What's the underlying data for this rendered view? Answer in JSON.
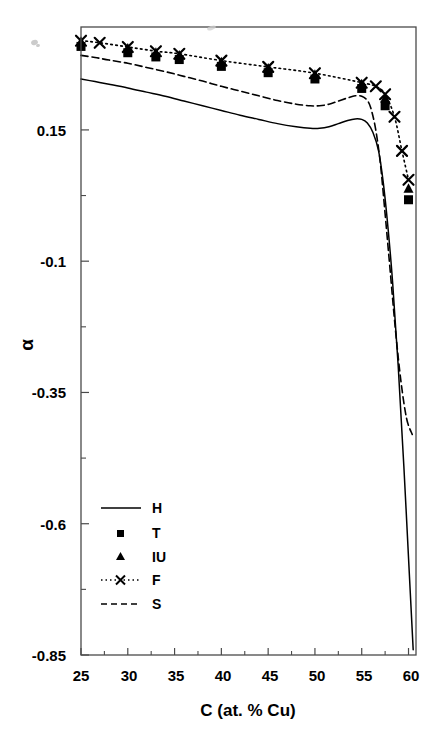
{
  "chart_data": {
    "type": "line",
    "title": "",
    "xlabel": "C (at. % Cu)",
    "ylabel": "α",
    "xlim": [
      25,
      60.8
    ],
    "ylim": [
      -0.85,
      0.346
    ],
    "xticks": [
      25,
      30,
      35,
      40,
      45,
      50,
      55,
      60
    ],
    "xticklabels": [
      "25",
      "30",
      "35",
      "40",
      "45",
      "50",
      "55",
      "60"
    ],
    "xminorticks": [
      27.5,
      32.5,
      37.5,
      42.5,
      47.5,
      52.5,
      57.5
    ],
    "yticks": [
      0.15,
      -0.1,
      -0.35,
      -0.6,
      -0.85
    ],
    "yticklabels": [
      "0.15",
      "-0.1",
      "-0.35",
      "-0.6",
      "-0.85"
    ],
    "yminorticks": [
      0.025,
      -0.225,
      -0.475,
      -0.725
    ],
    "grid": false,
    "legend_position": "lower-left-inside",
    "series": [
      {
        "name": "H",
        "style": "solid-line",
        "x": [
          25.0,
          26.5,
          28.0,
          30.0,
          32.0,
          34.0,
          36.0,
          38.0,
          40.0,
          42.0,
          44.0,
          46.0,
          48.0,
          49.5,
          50.5,
          51.5,
          52.5,
          53.5,
          54.3,
          55.0,
          55.6,
          56.2,
          56.8,
          57.3,
          57.8,
          58.3,
          58.9,
          59.5,
          60.1,
          60.5
        ],
        "y": [
          0.247,
          0.242,
          0.237,
          0.23,
          0.222,
          0.214,
          0.205,
          0.196,
          0.187,
          0.178,
          0.17,
          0.162,
          0.156,
          0.153,
          0.153,
          0.156,
          0.162,
          0.168,
          0.171,
          0.17,
          0.163,
          0.145,
          0.11,
          0.05,
          -0.035,
          -0.14,
          -0.3,
          -0.49,
          -0.7,
          -0.84
        ]
      },
      {
        "name": "S",
        "style": "dashed-line",
        "x": [
          25.0,
          26.5,
          28.0,
          30.0,
          32.0,
          34.0,
          36.0,
          38.0,
          40.0,
          42.0,
          44.0,
          46.0,
          48.0,
          49.5,
          50.5,
          51.5,
          52.5,
          53.5,
          54.3,
          55.0,
          55.6,
          56.0,
          56.5,
          57.0,
          57.5,
          58.0,
          58.6,
          59.2,
          59.8,
          60.4
        ],
        "y": [
          0.292,
          0.288,
          0.283,
          0.277,
          0.269,
          0.261,
          0.252,
          0.243,
          0.233,
          0.224,
          0.215,
          0.206,
          0.199,
          0.196,
          0.196,
          0.199,
          0.205,
          0.211,
          0.215,
          0.214,
          0.206,
          0.19,
          0.15,
          0.085,
          -0.01,
          -0.11,
          -0.23,
          -0.33,
          -0.4,
          -0.43
        ]
      },
      {
        "name": "F",
        "style": "dotted-line-x",
        "x": [
          25.0,
          27.0,
          30.0,
          33.0,
          35.5,
          40.0,
          45.0,
          50.0,
          55.0,
          56.5,
          57.5,
          58.5,
          59.3,
          60.0
        ],
        "y": [
          0.32,
          0.316,
          0.308,
          0.3,
          0.295,
          0.282,
          0.27,
          0.258,
          0.24,
          0.233,
          0.218,
          0.175,
          0.11,
          0.055
        ]
      },
      {
        "name": "T",
        "style": "square-marker",
        "x": [
          25.0,
          30.0,
          33.0,
          35.5,
          40.0,
          45.0,
          50.0,
          55.0,
          57.5,
          60.0
        ],
        "y": [
          0.309,
          0.297,
          0.289,
          0.284,
          0.271,
          0.259,
          0.247,
          0.229,
          0.196,
          0.017
        ]
      },
      {
        "name": "IU",
        "style": "triangle-marker",
        "x": [
          25.0,
          30.0,
          33.0,
          35.5,
          40.0,
          45.0,
          50.0,
          55.0,
          57.5,
          60.0
        ],
        "y": [
          0.318,
          0.305,
          0.297,
          0.292,
          0.279,
          0.267,
          0.255,
          0.237,
          0.21,
          0.038
        ]
      }
    ],
    "legend": [
      {
        "label": "H",
        "style": "solid-line"
      },
      {
        "label": "T",
        "style": "square-marker"
      },
      {
        "label": "IU",
        "style": "triangle-marker"
      },
      {
        "label": "F",
        "style": "dotted-line-x"
      },
      {
        "label": "S",
        "style": "dashed-line"
      }
    ]
  },
  "axes": {
    "xlabel": "C (at. % Cu)",
    "ylabel": "α"
  },
  "xticklabels": {
    "t0": "25",
    "t1": "30",
    "t2": "35",
    "t3": "40",
    "t4": "45",
    "t5": "50",
    "t6": "55",
    "t7": "60"
  },
  "yticklabels": {
    "t0": "0.15",
    "t1": "-0.1",
    "t2": "-0.35",
    "t3": "-0.6",
    "t4": "-0.85"
  },
  "legend": {
    "l0": "H",
    "l1": "T",
    "l2": "IU",
    "l3": "F",
    "l4": "S"
  },
  "colors": {
    "line": "#000000",
    "marker": "#000000",
    "axis": "#4a4a4a",
    "background": "#ffffff"
  }
}
